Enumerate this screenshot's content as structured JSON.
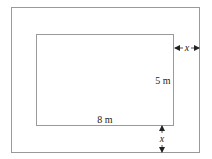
{
  "diagram": {
    "inner_width_label": "8 m",
    "inner_height_label": "5 m",
    "border_width_label_right": "x",
    "border_width_label_bottom": "x",
    "colors": {
      "outline": "#9a9a9a",
      "text": "#222222",
      "background": "#ffffff"
    }
  }
}
